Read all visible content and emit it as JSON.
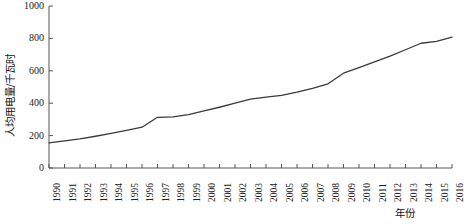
{
  "chart_data": {
    "type": "line",
    "title": "",
    "xlabel": "年份",
    "ylabel": "人均用电量/千瓦时",
    "xlim": [
      1990,
      2016
    ],
    "ylim": [
      0,
      1000
    ],
    "yticks": [
      0,
      200,
      400,
      600,
      800,
      1000
    ],
    "grid": false,
    "legend": "none",
    "categories": [
      "1990",
      "1991",
      "1992",
      "1993",
      "1994",
      "1995",
      "1996",
      "1997",
      "1998",
      "1999",
      "2000",
      "2001",
      "2002",
      "2003",
      "2004",
      "2005",
      "2006",
      "2007",
      "2008",
      "2009",
      "2010",
      "2011",
      "2012",
      "2013",
      "2014",
      "2015",
      "2016"
    ],
    "series": [
      {
        "name": "人均用电量",
        "values": [
          155,
          168,
          180,
          196,
          214,
          232,
          252,
          313,
          315,
          330,
          352,
          375,
          400,
          425,
          438,
          448,
          468,
          492,
          520,
          585,
          620,
          655,
          690,
          730,
          770,
          782,
          808
        ]
      }
    ]
  },
  "axes": {
    "y_tick_labels": [
      "0",
      "200",
      "400",
      "600",
      "800",
      "1000"
    ],
    "x_tick_labels": [
      "1990",
      "1991",
      "1992",
      "1993",
      "1994",
      "1995",
      "1996",
      "1997",
      "1998",
      "1999",
      "2000",
      "2001",
      "2002",
      "2003",
      "2004",
      "2005",
      "2006",
      "2007",
      "2008",
      "2009",
      "2010",
      "2011",
      "2012",
      "2013",
      "2014",
      "2015",
      "2016"
    ],
    "y_axis_title": "人均用电量/千瓦时",
    "x_axis_title": "年份"
  },
  "style": {
    "line_color": "#3a3a3a",
    "axis_color": "#555555",
    "background": "#ffffff"
  }
}
